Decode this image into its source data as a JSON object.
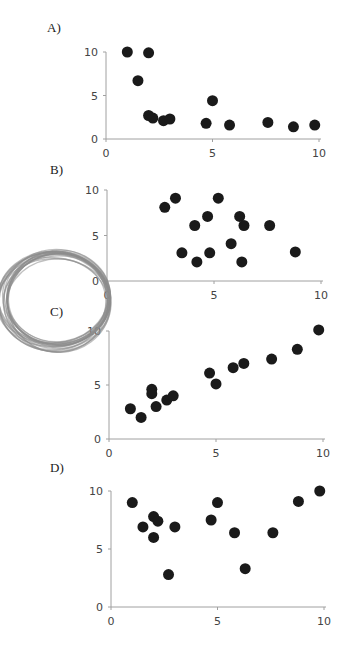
{
  "chart_data": [
    {
      "type": "scatter",
      "label": "A)",
      "xlim": [
        0,
        10
      ],
      "ylim": [
        0,
        10
      ],
      "xticks": [
        "0",
        "5",
        "10"
      ],
      "yticks": [
        "0",
        "5",
        "10"
      ],
      "grid": false,
      "legend": null,
      "points": [
        [
          1.0,
          10.0
        ],
        [
          2.0,
          9.9
        ],
        [
          1.5,
          6.7
        ],
        [
          2.0,
          2.7
        ],
        [
          2.2,
          2.4
        ],
        [
          2.7,
          2.1
        ],
        [
          3.0,
          2.3
        ],
        [
          4.7,
          1.8
        ],
        [
          5.0,
          4.4
        ],
        [
          5.8,
          1.6
        ],
        [
          7.6,
          1.9
        ],
        [
          8.8,
          1.4
        ],
        [
          9.8,
          1.6
        ]
      ]
    },
    {
      "type": "scatter",
      "label": "B)",
      "xlim": [
        0,
        10
      ],
      "ylim": [
        0,
        10
      ],
      "xticks": [
        "0",
        "5",
        "10"
      ],
      "yticks": [
        "0",
        "5",
        "10"
      ],
      "grid": false,
      "legend": null,
      "points": [
        [
          2.7,
          8.1
        ],
        [
          3.2,
          9.1
        ],
        [
          4.1,
          6.1
        ],
        [
          4.7,
          7.1
        ],
        [
          5.2,
          9.1
        ],
        [
          3.5,
          3.1
        ],
        [
          4.2,
          2.1
        ],
        [
          4.8,
          3.1
        ],
        [
          5.8,
          4.1
        ],
        [
          6.2,
          7.1
        ],
        [
          6.4,
          6.1
        ],
        [
          6.3,
          2.1
        ],
        [
          7.6,
          6.1
        ],
        [
          8.8,
          3.2
        ]
      ]
    },
    {
      "type": "scatter",
      "label": "C)",
      "xlim": [
        0,
        10
      ],
      "ylim": [
        0,
        10
      ],
      "xticks": [
        "0",
        "5",
        "10"
      ],
      "yticks": [
        "0",
        "5",
        "10"
      ],
      "grid": false,
      "legend": null,
      "points": [
        [
          1.0,
          2.8
        ],
        [
          1.5,
          2.0
        ],
        [
          2.0,
          4.6
        ],
        [
          2.0,
          4.2
        ],
        [
          2.2,
          3.0
        ],
        [
          2.7,
          3.6
        ],
        [
          3.0,
          4.0
        ],
        [
          4.7,
          6.1
        ],
        [
          5.0,
          5.1
        ],
        [
          5.8,
          6.6
        ],
        [
          6.3,
          7.0
        ],
        [
          7.6,
          7.4
        ],
        [
          8.8,
          8.3
        ],
        [
          9.8,
          10.1
        ]
      ]
    },
    {
      "type": "scatter",
      "label": "D)",
      "xlim": [
        0,
        10
      ],
      "ylim": [
        0,
        10
      ],
      "xticks": [
        "0",
        "5",
        "10"
      ],
      "yticks": [
        "0",
        "5",
        "10"
      ],
      "grid": false,
      "legend": null,
      "points": [
        [
          1.0,
          9.0
        ],
        [
          1.5,
          6.9
        ],
        [
          2.0,
          7.8
        ],
        [
          2.0,
          6.0
        ],
        [
          2.2,
          7.4
        ],
        [
          2.7,
          2.8
        ],
        [
          3.0,
          6.9
        ],
        [
          4.7,
          7.5
        ],
        [
          5.0,
          9.0
        ],
        [
          5.8,
          6.4
        ],
        [
          6.3,
          3.3
        ],
        [
          7.6,
          6.4
        ],
        [
          8.8,
          9.1
        ],
        [
          9.8,
          10.0
        ]
      ]
    }
  ],
  "layout": [
    {
      "x0": 106,
      "x1": 319,
      "y0": 139,
      "y1": 52,
      "label_x": 47,
      "label_y": 20
    },
    {
      "x0": 107,
      "x1": 321,
      "y0": 281,
      "y1": 190,
      "label_x": 50,
      "label_y": 162
    },
    {
      "x0": 109,
      "x1": 323,
      "y0": 439,
      "y1": 331,
      "label_x": 50,
      "label_y": 304
    },
    {
      "x0": 111,
      "x1": 324,
      "y0": 607,
      "y1": 491,
      "label_x": 50,
      "label_y": 460
    }
  ],
  "colors": {
    "point": "#1a1a1a",
    "axis": "#a0a0a0",
    "coil": "#8c8c8c"
  },
  "decoration": "coiled-wire"
}
